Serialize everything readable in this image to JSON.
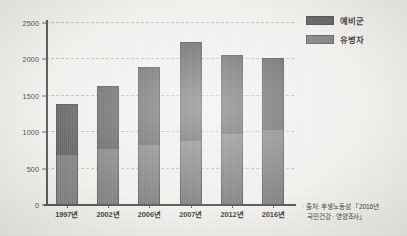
{
  "chart_data": {
    "type": "bar",
    "stacked": true,
    "title": "",
    "subtitle": "",
    "xlabel": "",
    "ylabel": "",
    "categories": [
      "1997년",
      "2002년",
      "2006년",
      "2007년",
      "2012년",
      "2016년"
    ],
    "series": [
      {
        "name": "유병자",
        "values": [
          680,
          750,
          810,
          870,
          960,
          1010
        ],
        "color": "#6f6f6f",
        "stack_position": "bottom"
      },
      {
        "name": "예비군",
        "values": [
          690,
          870,
          1070,
          1355,
          1090,
          1000
        ],
        "color": "#4a4a4a",
        "stack_position": "top"
      }
    ],
    "totals": [
      1370,
      1620,
      1880,
      2225,
      2050,
      2010
    ],
    "ylim": [
      0,
      2500
    ],
    "yticks": [
      "0",
      "500",
      "1000",
      "1500",
      "2000",
      "2500"
    ],
    "ytick_values": [
      0,
      500,
      1000,
      1500,
      2000,
      2500
    ],
    "grid": "horizontal-dashed",
    "legend_position": "top-right"
  },
  "legend": {
    "items": [
      {
        "label": "예비군",
        "color": "#4a4a4a"
      },
      {
        "label": "유병자",
        "color": "#6f6f6f"
      }
    ]
  },
  "source_note": {
    "bullet": "·",
    "line1": "출처: 후생노동성 「2016년",
    "line2": "국민건강 · 영양조사」"
  },
  "axis": {
    "y_ticks": [
      "2500",
      "2000",
      "1500",
      "1000",
      "500",
      "0"
    ],
    "x_ticks": [
      "1997년",
      "2002년",
      "2006년",
      "2007년",
      "2012년",
      "2016년"
    ]
  },
  "colors": {
    "series_top": "#4a4a4a",
    "series_bottom": "#6f6f6f",
    "axis": "#3f3f3d",
    "grid": "#b9b7b2",
    "background": "#f2f1ee"
  }
}
